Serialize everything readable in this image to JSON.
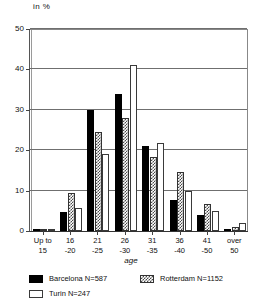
{
  "chart_data": {
    "type": "bar",
    "title": "",
    "xlabel": "age",
    "ylabel": "in %",
    "ylim": [
      0,
      50
    ],
    "yticks": [
      0,
      10,
      20,
      30,
      40,
      50
    ],
    "grid": true,
    "legend_position": "bottom-left",
    "categories": [
      "Up to\n15",
      "16\n-20",
      "21\n-25",
      "26\n-30",
      "31\n-35",
      "36\n-40",
      "41\n-50",
      "over\n50"
    ],
    "series": [
      {
        "name": "Barcelona N=587",
        "short_name": "Barcelona",
        "n": 587,
        "fill": "solid-black",
        "color": "#000000",
        "values": [
          0.3,
          4.8,
          30.0,
          34.0,
          21.0,
          7.6,
          4.0,
          0.4
        ]
      },
      {
        "name": "Rotterdam N=1152",
        "short_name": "Rotterdam",
        "n": 1152,
        "fill": "checker-gray",
        "color": "#4a4a4a",
        "values": [
          0.4,
          9.5,
          24.6,
          28.0,
          18.3,
          14.6,
          6.8,
          0.9
        ]
      },
      {
        "name": "Turin N=247",
        "short_name": "Turin",
        "n": 247,
        "fill": "white-outline",
        "color": "#ffffff",
        "values": [
          0.4,
          5.6,
          19.0,
          41.0,
          21.8,
          10.0,
          5.0,
          2.0
        ]
      }
    ]
  },
  "axis": {
    "y_title": "in %",
    "x_title": "age"
  },
  "legend": {
    "items": [
      {
        "label": "Barcelona N=587"
      },
      {
        "label": "Rotterdam N=1152"
      },
      {
        "label": "Turin N=247"
      }
    ]
  }
}
